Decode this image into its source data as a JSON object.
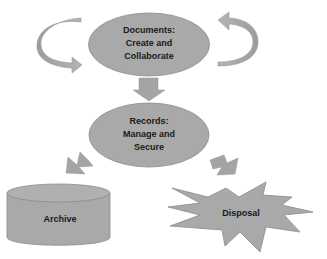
{
  "diagram": {
    "type": "records-lifecycle-flow",
    "colors": {
      "shape_fill": "#a9a9a9",
      "shape_stroke": "#8c8c8c",
      "arrow_fill": "#a4a4a4",
      "text": "#1a1a1a",
      "background": "#ffffff"
    },
    "nodes": {
      "documents": {
        "shape": "ellipse",
        "line1": "Documents:",
        "line2": "Create and",
        "line3": "Collaborate"
      },
      "records": {
        "shape": "ellipse",
        "line1": "Records:",
        "line2": "Manage and",
        "line3": "Secure"
      },
      "archive": {
        "shape": "cylinder",
        "label": "Archive"
      },
      "disposal": {
        "shape": "explosion",
        "label": "Disposal"
      }
    },
    "edges": [
      {
        "from": "documents",
        "to": "documents",
        "style": "curved-arrow-left"
      },
      {
        "from": "documents",
        "to": "documents",
        "style": "curved-arrow-right"
      },
      {
        "from": "documents",
        "to": "records",
        "style": "block-arrow-down"
      },
      {
        "from": "records",
        "to": "archive",
        "style": "block-arrow-down-left"
      },
      {
        "from": "records",
        "to": "disposal",
        "style": "block-arrow-down-right"
      }
    ]
  }
}
